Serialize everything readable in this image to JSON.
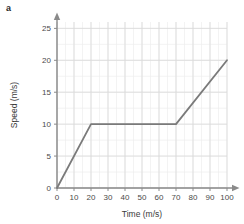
{
  "panel": {
    "label": "a"
  },
  "chart_data": {
    "type": "line",
    "title": "",
    "xlabel": "Time (m/s)",
    "ylabel": "Speed (m/s)",
    "xlim": [
      0,
      100
    ],
    "ylim": [
      0,
      26
    ],
    "xticks": [
      0,
      10,
      20,
      30,
      40,
      50,
      60,
      70,
      80,
      90,
      100
    ],
    "yticks": [
      0,
      5,
      10,
      15,
      20,
      25
    ],
    "xtick_labels": [
      "0",
      "10",
      "20",
      "30",
      "40",
      "50",
      "60",
      "70",
      "80",
      "90",
      "100"
    ],
    "ytick_labels": [
      "0",
      "5",
      "10",
      "15",
      "20",
      "25"
    ],
    "x_minor_step": 5,
    "y_minor_step": 2.5,
    "grid": true,
    "legend": false,
    "legend_position": "none",
    "axis_arrows": true,
    "series": [
      {
        "name": "speed",
        "color": "#7a7a7a",
        "x": [
          0,
          20,
          70,
          100
        ],
        "values": [
          0,
          10,
          10,
          20
        ],
        "points": [
          {
            "x": 0,
            "y": 0
          },
          {
            "x": 20,
            "y": 10
          },
          {
            "x": 70,
            "y": 10
          },
          {
            "x": 100,
            "y": 20
          }
        ]
      }
    ]
  },
  "colors": {
    "line": "#7a7a7a",
    "axis": "#8a8a8a",
    "grid_major": "#d9d9d9",
    "grid_minor": "#eeeeee",
    "text": "#3a3a3a",
    "background": "#ffffff"
  }
}
